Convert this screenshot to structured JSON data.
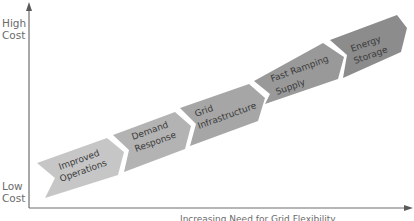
{
  "diagram": {
    "y_axis": {
      "high_label_line1": "High",
      "high_label_line2": "Cost",
      "low_label_line1": "Low",
      "low_label_line2": "Cost"
    },
    "x_axis": {
      "label": "Increasing Need for Grid Flexibility"
    },
    "steps": [
      {
        "line1": "Improved",
        "line2": "Operations",
        "color": "#c6c6c6"
      },
      {
        "line1": "Demand",
        "line2": "Response",
        "color": "#b3b3b3"
      },
      {
        "line1": "Grid",
        "line2": "Infrastructure",
        "color": "#a6a6a6"
      },
      {
        "line1": "Fast Ramping",
        "line2": "Supply",
        "color": "#999999"
      },
      {
        "line1": "Energy",
        "line2": "Storage",
        "color": "#8c8c8c"
      }
    ],
    "colors": {
      "axis": "#6e6e6e",
      "text": "#3a3a3a",
      "axis_text": "#6b6b6b"
    }
  }
}
